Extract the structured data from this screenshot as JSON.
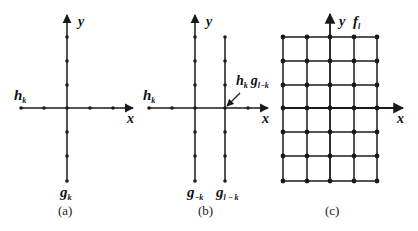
{
  "panels": [
    {
      "id": "a",
      "caption": "(a)",
      "axis_x_label": "x",
      "axis_y_label": "y",
      "horizontal_label": "h",
      "horizontal_label_sub": "k",
      "vertical_label": "g",
      "vertical_label_sub": "k"
    },
    {
      "id": "b",
      "caption": "(b)",
      "axis_x_label": "x",
      "axis_y_label": "y",
      "horizontal_label": "h",
      "horizontal_label_sub": "k",
      "vertical_label_left": "g",
      "vertical_label_left_sub": "−k",
      "vertical_label_right": "g",
      "vertical_label_right_sub": "l − k",
      "annotation_h": "h",
      "annotation_h_sub": "k",
      "annotation_g": "g",
      "annotation_g_sub": "l−k"
    },
    {
      "id": "c",
      "caption": "(c)",
      "axis_x_label": "x",
      "axis_y_label": "y",
      "grid_label": "f",
      "grid_label_sub": "l"
    }
  ],
  "colors": {
    "line": "#1a1a1a",
    "background": "#ffffff"
  }
}
